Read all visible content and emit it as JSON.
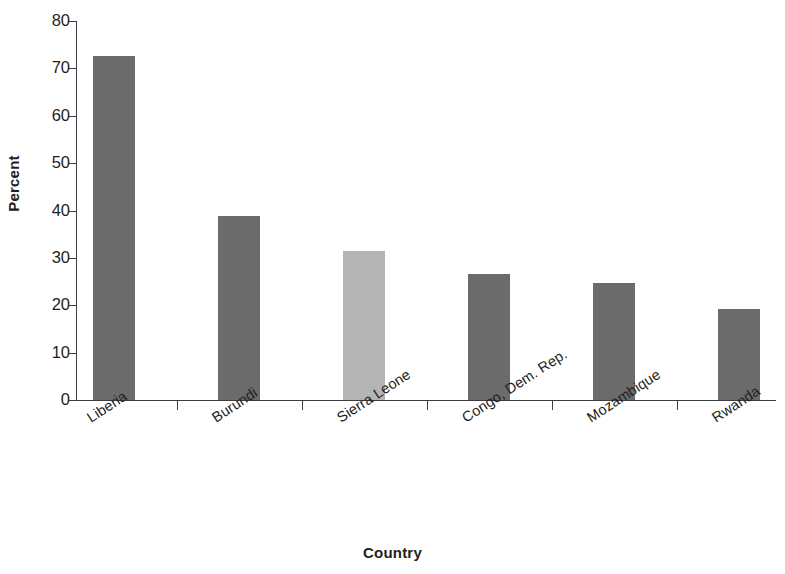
{
  "chart_data": {
    "type": "bar",
    "title": "",
    "xlabel": "Country",
    "ylabel": "Percent",
    "categories": [
      "Liberia",
      "Burundi",
      "Sierra Leone",
      "Congo, Dem. Rep.",
      "Mozambique",
      "Rwanda"
    ],
    "values": [
      72.6,
      38.8,
      31.4,
      26.5,
      24.8,
      19.3
    ],
    "ylim": [
      0,
      80
    ],
    "yticks": [
      0,
      10,
      20,
      30,
      40,
      50,
      60,
      70,
      80
    ],
    "ytick_labels": [
      "0",
      "10",
      "20",
      "30",
      "40",
      "50",
      "60",
      "70",
      "80"
    ],
    "grid": false,
    "legend": null,
    "bar_colors": [
      "#6b6b6b",
      "#6b6b6b",
      "#b4b4b4",
      "#6b6b6b",
      "#6b6b6b",
      "#6b6b6b"
    ],
    "highlight_category": "Sierra Leone",
    "axis_color": "#3d3d3d",
    "text_color": "#231f20",
    "background": "#ffffff"
  }
}
